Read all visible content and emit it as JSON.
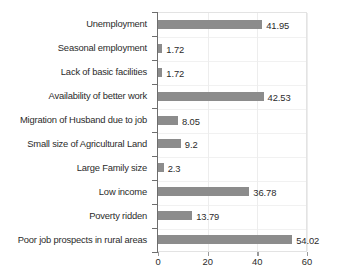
{
  "chart_data": {
    "type": "bar",
    "orientation": "horizontal",
    "title": "",
    "subtitle": "",
    "xlabel": "",
    "ylabel": "",
    "xlim": [
      0,
      60
    ],
    "ylim": null,
    "grid": true,
    "legend": null,
    "legend_position": "none",
    "xticks": [
      0,
      20,
      40,
      60
    ],
    "xtick_labels": [
      "0",
      "20",
      "40",
      "60"
    ],
    "bar_color": "#8c8c8c",
    "axis_color": "#6e6e6e",
    "grid_color": "#ededed",
    "text_color": "#2b2b2b",
    "categories": [
      "Unemployment",
      "Seasonal employment",
      "Lack of basic facilities",
      "Availability of better work",
      "Migration of Husband due to job",
      "Small size of Agricultural Land",
      "Large Family size",
      "Low income",
      "Poverty ridden",
      "Poor job prospects in rural areas"
    ],
    "values": [
      41.95,
      1.72,
      1.72,
      42.53,
      8.05,
      9.2,
      2.3,
      36.78,
      13.79,
      54.02
    ],
    "value_labels": [
      "41.95",
      "1.72",
      "1.72",
      "42.53",
      "8.05",
      "9.2",
      "2.3",
      "36.78",
      "13.79",
      "54.02"
    ],
    "bars": [
      {
        "category": "Unemployment",
        "value": 41.95,
        "label": "41.95"
      },
      {
        "category": "Seasonal employment",
        "value": 1.72,
        "label": "1.72"
      },
      {
        "category": "Lack of basic facilities",
        "value": 1.72,
        "label": "1.72"
      },
      {
        "category": "Availability of better work",
        "value": 42.53,
        "label": "42.53"
      },
      {
        "category": "Migration of Husband due to job",
        "value": 8.05,
        "label": "8.05"
      },
      {
        "category": "Small size of Agricultural Land",
        "value": 9.2,
        "label": "9.2"
      },
      {
        "category": "Large Family size",
        "value": 2.3,
        "label": "2.3"
      },
      {
        "category": "Low income",
        "value": 36.78,
        "label": "36.78"
      },
      {
        "category": "Poverty ridden",
        "value": 13.79,
        "label": "13.79"
      },
      {
        "category": "Poor job prospects in rural areas",
        "value": 54.02,
        "label": "54.02"
      }
    ]
  }
}
